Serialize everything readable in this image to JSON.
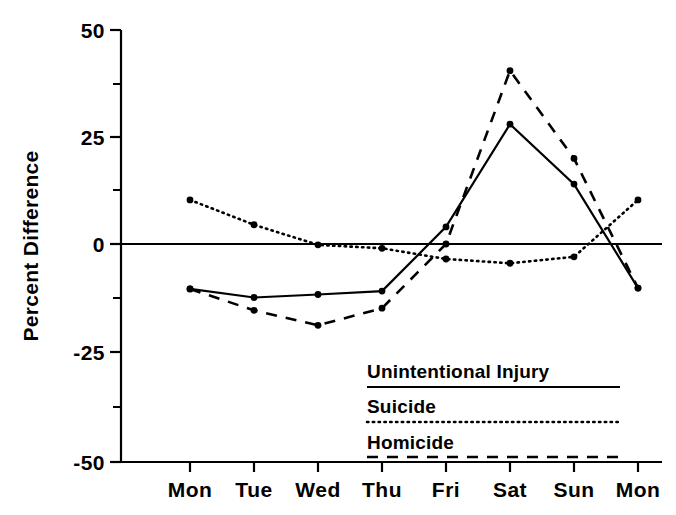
{
  "chart_data": {
    "type": "line",
    "title": "",
    "xlabel": "",
    "ylabel": "Percent Difference",
    "categories": [
      "Mon",
      "Tue",
      "Wed",
      "Thu",
      "Fri",
      "Sat",
      "Sun",
      "Mon"
    ],
    "ylim": [
      -50,
      50
    ],
    "yticks": [
      50,
      25,
      0,
      -25,
      -50
    ],
    "ytick_labels": [
      "50",
      "25",
      "0",
      "-25",
      "-50"
    ],
    "yminor_ticks": [
      37.5,
      12.5,
      -12.5,
      -37.5
    ],
    "grid": false,
    "legend_position": "inside-bottom-right",
    "series": [
      {
        "name": "Unintentional Injury",
        "style": "solid",
        "values": [
          -10.5,
          -12.5,
          -11.8,
          -11.0,
          4.0,
          28.0,
          14.0,
          -10.3
        ]
      },
      {
        "name": "Suicide",
        "style": "dotted",
        "values": [
          10.3,
          4.5,
          -0.2,
          -1.0,
          -3.5,
          -4.5,
          -3.0,
          10.3
        ]
      },
      {
        "name": "Homicide",
        "style": "dashed",
        "values": [
          -10.5,
          -15.5,
          -19.0,
          -15.0,
          0.0,
          40.5,
          20.0,
          -10.3
        ]
      }
    ]
  },
  "axis": {
    "y_title": "Percent Difference"
  },
  "legend": {
    "items": [
      {
        "label": "Unintentional Injury",
        "style": "solid"
      },
      {
        "label": "Suicide",
        "style": "dotted"
      },
      {
        "label": "Homicide",
        "style": "dashed"
      }
    ]
  },
  "colors": {
    "ink": "#000000",
    "background": "#ffffff"
  }
}
